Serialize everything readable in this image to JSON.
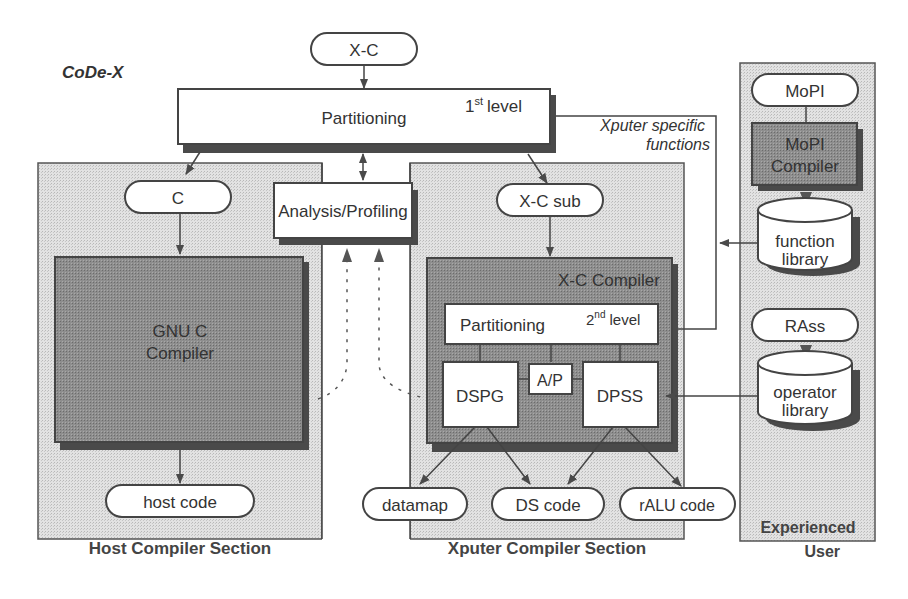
{
  "title": "CoDe-X",
  "nodes": {
    "xc_input": "X-C",
    "partitioning_1": "Partitioning",
    "partitioning_1_level_num": "1",
    "partitioning_1_level_sup": "st",
    "partitioning_1_level_word": "level",
    "c_input": "C",
    "analysis_profiling": "Analysis/Profiling",
    "xc_sub": "X-C sub",
    "gnu_compiler_line1": "GNU C",
    "gnu_compiler_line2": "Compiler",
    "host_code": "host code",
    "xc_compiler": "X-C Compiler",
    "partitioning_2": "Partitioning",
    "partitioning_2_level_num": "2",
    "partitioning_2_level_sup": "nd",
    "partitioning_2_level_word": "level",
    "dspg": "DSPG",
    "ap": "A/P",
    "dpss": "DPSS",
    "datamap": "datamap",
    "ds_code": "DS code",
    "ralu_code": "rALU code",
    "mopi_input": "MoPI",
    "mopi_compiler_line1": "MoPI",
    "mopi_compiler_line2": "Compiler",
    "function_library_line1": "function",
    "function_library_line2": "library",
    "rass_input": "RAss",
    "operator_library_line1": "operator",
    "operator_library_line2": "library"
  },
  "annotations": {
    "xputer_specific_line1": "Xputer specific",
    "xputer_specific_line2": "functions"
  },
  "sections": {
    "host": "Host Compiler Section",
    "xputer": "Xputer Compiler Section",
    "experienced_line1": "Experienced",
    "experienced_line2": "User"
  },
  "colors": {
    "section_fill": "#d9d9d9",
    "dark_box_fill": "#8a8a8a",
    "stroke": "#444444"
  }
}
